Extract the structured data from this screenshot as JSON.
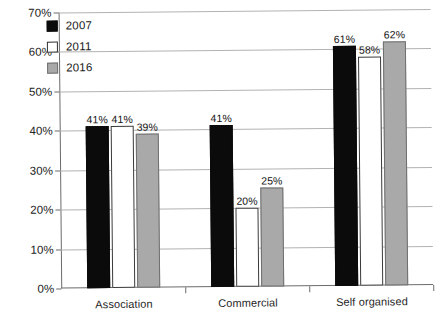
{
  "chart_data": {
    "type": "bar",
    "title": "",
    "subtitle": "",
    "xlabel": "",
    "ylabel": "",
    "categories": [
      "Association",
      "Commercial",
      "Self organised"
    ],
    "series": [
      {
        "name": "2007",
        "color": "#0b0b0b",
        "values": [
          41,
          41,
          61
        ],
        "labels": [
          "41%",
          "41%",
          "61%"
        ]
      },
      {
        "name": "2011",
        "color": "#ffffff",
        "values": [
          41,
          20,
          58
        ],
        "labels": [
          "41%",
          "20%",
          "58%"
        ]
      },
      {
        "name": "2016",
        "color": "#a9a9a9",
        "values": [
          39,
          25,
          62
        ],
        "labels": [
          "39%",
          "20%",
          "62%"
        ]
      }
    ],
    "ylim": [
      0,
      70
    ],
    "y_ticks": [
      0,
      10,
      20,
      30,
      40,
      50,
      60,
      70
    ],
    "y_tick_labels": [
      "0%",
      "10%",
      "20%",
      "30%",
      "40%",
      "50%",
      "60%",
      "70%"
    ],
    "value_suffix": "%",
    "grid": true,
    "legend_position": "top-left",
    "legend": [
      "2007",
      "2011",
      "2016"
    ]
  }
}
